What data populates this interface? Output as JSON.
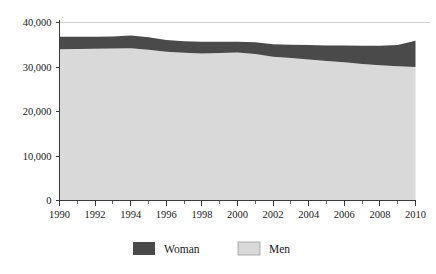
{
  "chart_data": {
    "type": "area",
    "stacked": true,
    "title": "",
    "subtitle": "",
    "xlabel": "",
    "ylabel": "",
    "x": [
      1990,
      1991,
      1992,
      1993,
      1994,
      1995,
      1996,
      1997,
      1998,
      1999,
      2000,
      2001,
      2002,
      2003,
      2004,
      2005,
      2006,
      2007,
      2008,
      2009,
      2010
    ],
    "categories": [
      "1990",
      "1991",
      "1992",
      "1993",
      "1994",
      "1995",
      "1996",
      "1997",
      "1998",
      "1999",
      "2000",
      "2001",
      "2002",
      "2003",
      "2004",
      "2005",
      "2006",
      "2007",
      "2008",
      "2009",
      "2010"
    ],
    "series": [
      {
        "name": "Men",
        "color": "#d9d9d9",
        "values": [
          34000,
          34050,
          34100,
          34150,
          34200,
          33900,
          33400,
          33200,
          33050,
          33150,
          33250,
          32900,
          32300,
          32000,
          31700,
          31350,
          31050,
          30700,
          30400,
          30150,
          30000
        ]
      },
      {
        "name": "Woman",
        "color": "#4a4a4a",
        "values": [
          2800,
          2750,
          2700,
          2700,
          2900,
          2800,
          2650,
          2600,
          2600,
          2500,
          2450,
          2650,
          2800,
          3000,
          3250,
          3500,
          3800,
          4100,
          4400,
          4800,
          5900
        ]
      }
    ],
    "totals": [
      36800,
      36800,
      36800,
      36850,
      37100,
      36700,
      36050,
      35800,
      35650,
      35650,
      35700,
      35550,
      35100,
      35000,
      34950,
      34850,
      34850,
      34800,
      34800,
      34950,
      35900
    ],
    "ylim": [
      0,
      40000
    ],
    "xlim": [
      1990,
      2010
    ],
    "yticks": [
      0,
      10000,
      20000,
      30000,
      40000
    ],
    "ytick_labels": [
      "0",
      "10,000",
      "20,000",
      "30,000",
      "40,000"
    ],
    "xticks_major": [
      1990,
      1992,
      1994,
      1996,
      1998,
      2000,
      2002,
      2004,
      2006,
      2008,
      2010
    ],
    "xtick_labels": [
      "1990",
      "1992",
      "1994",
      "1996",
      "1998",
      "2000",
      "2002",
      "2004",
      "2006",
      "2008",
      "2010"
    ],
    "xticks_minor": [
      1991,
      1993,
      1995,
      1997,
      1999,
      2001,
      2003,
      2005,
      2007,
      2009
    ],
    "grid": "top-only",
    "legend_position": "bottom-center",
    "legend": [
      {
        "label": "Woman",
        "color": "#4a4a4a"
      },
      {
        "label": "Men",
        "color": "#d9d9d9"
      }
    ]
  },
  "axes": {
    "y": {
      "labels": [
        "40,000",
        "30,000",
        "20,000",
        "10,000",
        "0"
      ]
    },
    "x": {
      "labels": [
        "1990",
        "1992",
        "1994",
        "1996",
        "1998",
        "2000",
        "2002",
        "2004",
        "2006",
        "2008",
        "2010"
      ]
    }
  },
  "legend": {
    "items": [
      {
        "label": "Woman",
        "swatch": "dark-swatch-icon"
      },
      {
        "label": "Men",
        "swatch": "light-swatch-icon"
      }
    ]
  },
  "colors": {
    "woman": "#4a4a4a",
    "men": "#d9d9d9",
    "axis": "#3a3a3a",
    "gridline": "#d0d0d0",
    "background": "#ffffff",
    "text": "#1a1a1a"
  }
}
